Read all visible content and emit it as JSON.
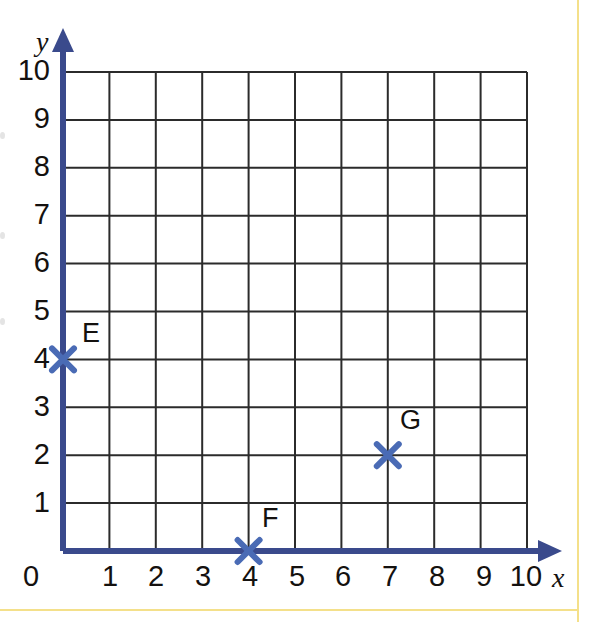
{
  "figure": {
    "background_color": "#ffffff",
    "frame_color": "#f4e08a",
    "axis_color": "#3a4a8c",
    "grid_color": "#2b2b2b",
    "marker_color": "#4a6bb5",
    "text_color": "#14110f"
  },
  "axes": {
    "x_name": "x",
    "y_name": "y",
    "x_ticks": [
      "0",
      "1",
      "2",
      "3",
      "4",
      "5",
      "6",
      "7",
      "8",
      "9",
      "10"
    ],
    "y_ticks": [
      "1",
      "2",
      "3",
      "4",
      "5",
      "6",
      "7",
      "8",
      "9",
      "10"
    ],
    "origin_label": "0"
  },
  "chart_data": {
    "type": "scatter",
    "title": "",
    "xlabel": "x",
    "ylabel": "y",
    "xlim": [
      0,
      10
    ],
    "ylim": [
      0,
      10
    ],
    "xticks": [
      0,
      1,
      2,
      3,
      4,
      5,
      6,
      7,
      8,
      9,
      10
    ],
    "yticks": [
      0,
      1,
      2,
      3,
      4,
      5,
      6,
      7,
      8,
      9,
      10
    ],
    "grid": true,
    "grid_step": 1,
    "legend": "none",
    "marker_style": "x-cross",
    "points": [
      {
        "label": "E",
        "x": 0,
        "y": 4
      },
      {
        "label": "F",
        "x": 4,
        "y": 0
      },
      {
        "label": "G",
        "x": 7,
        "y": 2
      }
    ],
    "point_labels": {
      "E": "E",
      "F": "F",
      "G": "G"
    }
  }
}
